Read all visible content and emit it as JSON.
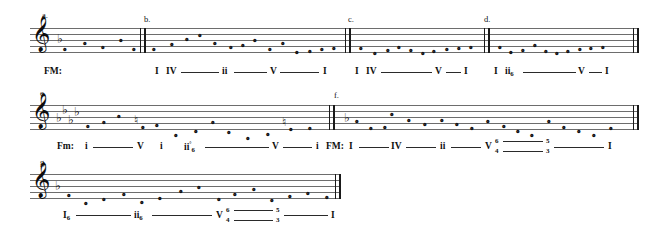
{
  "document": {
    "title": "Roman Numeral Harmonic Analysis Worksheet",
    "clef_glyph": "𝄞",
    "notehead_glyph": "𝅝",
    "flat_glyph": "♭",
    "natural_glyph": "♮",
    "diminished_glyph": "°"
  },
  "systems": [
    {
      "id": "system-1",
      "exercises": [
        {
          "label": "a.",
          "key_label": "FM:",
          "key_signature": "1-flat",
          "analysis": "",
          "notes": [
            {
              "x": 63,
              "y": 47
            },
            {
              "x": 83,
              "y": 41
            },
            {
              "x": 101,
              "y": 45
            },
            {
              "x": 119,
              "y": 38
            },
            {
              "x": 134,
              "y": 47
            }
          ]
        },
        {
          "label": "b.",
          "key_label": "",
          "analysis": "I IV —— ii —— V —— I",
          "roman_numerals": [
            "I",
            "IV",
            "ii",
            "V",
            "I"
          ],
          "notes": [
            {
              "x": 155,
              "y": 47
            },
            {
              "x": 172,
              "y": 42
            },
            {
              "x": 187,
              "y": 37
            },
            {
              "x": 200,
              "y": 33
            },
            {
              "x": 215,
              "y": 41
            },
            {
              "x": 231,
              "y": 45
            },
            {
              "x": 243,
              "y": 43
            },
            {
              "x": 255,
              "y": 38
            },
            {
              "x": 270,
              "y": 47
            },
            {
              "x": 283,
              "y": 41
            },
            {
              "x": 297,
              "y": 50
            },
            {
              "x": 310,
              "y": 49
            },
            {
              "x": 323,
              "y": 47
            },
            {
              "x": 333,
              "y": 46
            }
          ]
        },
        {
          "label": "c.",
          "key_label": "",
          "analysis": "I IV —— V — I",
          "roman_numerals": [
            "I",
            "IV",
            "V",
            "I"
          ],
          "notes": [
            {
              "x": 361,
              "y": 46
            },
            {
              "x": 375,
              "y": 51
            },
            {
              "x": 388,
              "y": 48
            },
            {
              "x": 399,
              "y": 45
            },
            {
              "x": 411,
              "y": 48
            },
            {
              "x": 423,
              "y": 51
            },
            {
              "x": 434,
              "y": 49
            },
            {
              "x": 447,
              "y": 47
            },
            {
              "x": 459,
              "y": 46
            },
            {
              "x": 471,
              "y": 45
            }
          ]
        },
        {
          "label": "d.",
          "key_label": "",
          "analysis": "I ii6 —— V — I",
          "roman_numerals": [
            "I",
            "ii",
            "V",
            "I"
          ],
          "notes": [
            {
              "x": 500,
              "y": 45
            },
            {
              "x": 511,
              "y": 50
            },
            {
              "x": 523,
              "y": 48
            },
            {
              "x": 535,
              "y": 43
            },
            {
              "x": 546,
              "y": 49
            },
            {
              "x": 557,
              "y": 51
            },
            {
              "x": 568,
              "y": 49
            },
            {
              "x": 580,
              "y": 47
            },
            {
              "x": 591,
              "y": 46
            },
            {
              "x": 603,
              "y": 45
            }
          ]
        }
      ]
    },
    {
      "id": "system-2",
      "exercises": [
        {
          "label": "e.",
          "key_label": "Fm:",
          "key_signature": "4-flats",
          "analysis": "i —— V  i  ii°6 —— V —— i",
          "roman_numerals": [
            "i",
            "V",
            "i",
            "ii°",
            "V",
            "i"
          ],
          "notes": [
            {
              "x": 88,
              "y": 124
            },
            {
              "x": 104,
              "y": 120
            },
            {
              "x": 119,
              "y": 114
            },
            {
              "x": 142,
              "y": 125
            },
            {
              "x": 156,
              "y": 123
            },
            {
              "x": 176,
              "y": 133
            },
            {
              "x": 196,
              "y": 129
            },
            {
              "x": 213,
              "y": 120
            },
            {
              "x": 229,
              "y": 130
            },
            {
              "x": 248,
              "y": 136
            },
            {
              "x": 268,
              "y": 132
            },
            {
              "x": 290,
              "y": 127
            },
            {
              "x": 310,
              "y": 126
            }
          ]
        },
        {
          "label": "f.",
          "key_label": "FM:",
          "key_signature": "1-flat",
          "analysis": "I — IV — ii — V 6/4 — 5/3 — I",
          "roman_numerals": [
            "I",
            "IV",
            "ii",
            "V",
            "I"
          ],
          "figures": [
            "6",
            "4",
            "5",
            "3"
          ],
          "notes": [
            {
              "x": 353,
              "y": 119
            },
            {
              "x": 369,
              "y": 126
            },
            {
              "x": 385,
              "y": 125
            },
            {
              "x": 392,
              "y": 112
            },
            {
              "x": 409,
              "y": 118
            },
            {
              "x": 425,
              "y": 122
            },
            {
              "x": 442,
              "y": 118
            },
            {
              "x": 457,
              "y": 122
            },
            {
              "x": 472,
              "y": 126
            },
            {
              "x": 488,
              "y": 119
            },
            {
              "x": 504,
              "y": 124
            },
            {
              "x": 518,
              "y": 129
            },
            {
              "x": 532,
              "y": 133
            },
            {
              "x": 549,
              "y": 119
            },
            {
              "x": 564,
              "y": 125
            },
            {
              "x": 579,
              "y": 129
            },
            {
              "x": 594,
              "y": 133
            },
            {
              "x": 611,
              "y": 126
            }
          ]
        }
      ]
    },
    {
      "id": "system-3",
      "exercises": [
        {
          "label": "g.",
          "key_label": "",
          "key_signature": "1-flat",
          "analysis": "I6 —— ii6 —— V 6/4 — 5/3 — I",
          "roman_numerals": [
            "I",
            "ii",
            "V",
            "I"
          ],
          "figures": [
            "6",
            "4",
            "5",
            "3"
          ],
          "notes": [
            {
              "x": 69,
              "y": 193
            },
            {
              "x": 86,
              "y": 201
            },
            {
              "x": 104,
              "y": 197
            },
            {
              "x": 124,
              "y": 192
            },
            {
              "x": 142,
              "y": 200
            },
            {
              "x": 160,
              "y": 196
            },
            {
              "x": 181,
              "y": 189
            },
            {
              "x": 199,
              "y": 185
            },
            {
              "x": 219,
              "y": 197
            },
            {
              "x": 235,
              "y": 192
            },
            {
              "x": 254,
              "y": 187
            },
            {
              "x": 272,
              "y": 198
            },
            {
              "x": 290,
              "y": 194
            },
            {
              "x": 308,
              "y": 191
            },
            {
              "x": 327,
              "y": 195
            }
          ]
        }
      ]
    }
  ],
  "labels": {
    "a": "a.",
    "b": "b.",
    "c": "c.",
    "d": "d.",
    "e": "e.",
    "f": "f.",
    "g": "g.",
    "fm_major": "FM:",
    "fm_minor": "Fm:",
    "fm_major_2": "FM:",
    "rn_I": "I",
    "rn_IV": "IV",
    "rn_ii": "ii",
    "rn_V": "V",
    "rn_i": "i",
    "fig6": "6",
    "fig4": "4",
    "fig5": "5",
    "fig3": "3"
  }
}
